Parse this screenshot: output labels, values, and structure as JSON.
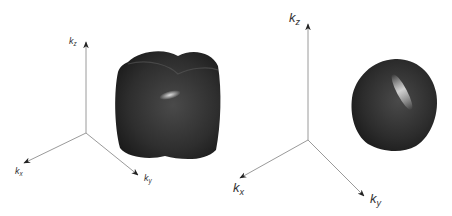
{
  "panels": [
    {
      "name": "left",
      "shape": "rounded-cube isosurface",
      "axes": {
        "kz": {
          "base": "k",
          "sub": "z"
        },
        "kx": {
          "base": "k",
          "sub": "x"
        },
        "ky": {
          "base": "k",
          "sub": "y"
        }
      }
    },
    {
      "name": "right",
      "shape": "rounded-blob isosurface",
      "axes": {
        "kz": {
          "base": "k",
          "sub": "z"
        },
        "kx": {
          "base": "k",
          "sub": "x"
        },
        "ky": {
          "base": "k",
          "sub": "y"
        }
      }
    }
  ],
  "colors": {
    "axis": "#9a9a9a",
    "surface_dark": "#1e1e1e",
    "surface_mid": "#3c3c3c",
    "highlight": "#d8d8d8"
  }
}
